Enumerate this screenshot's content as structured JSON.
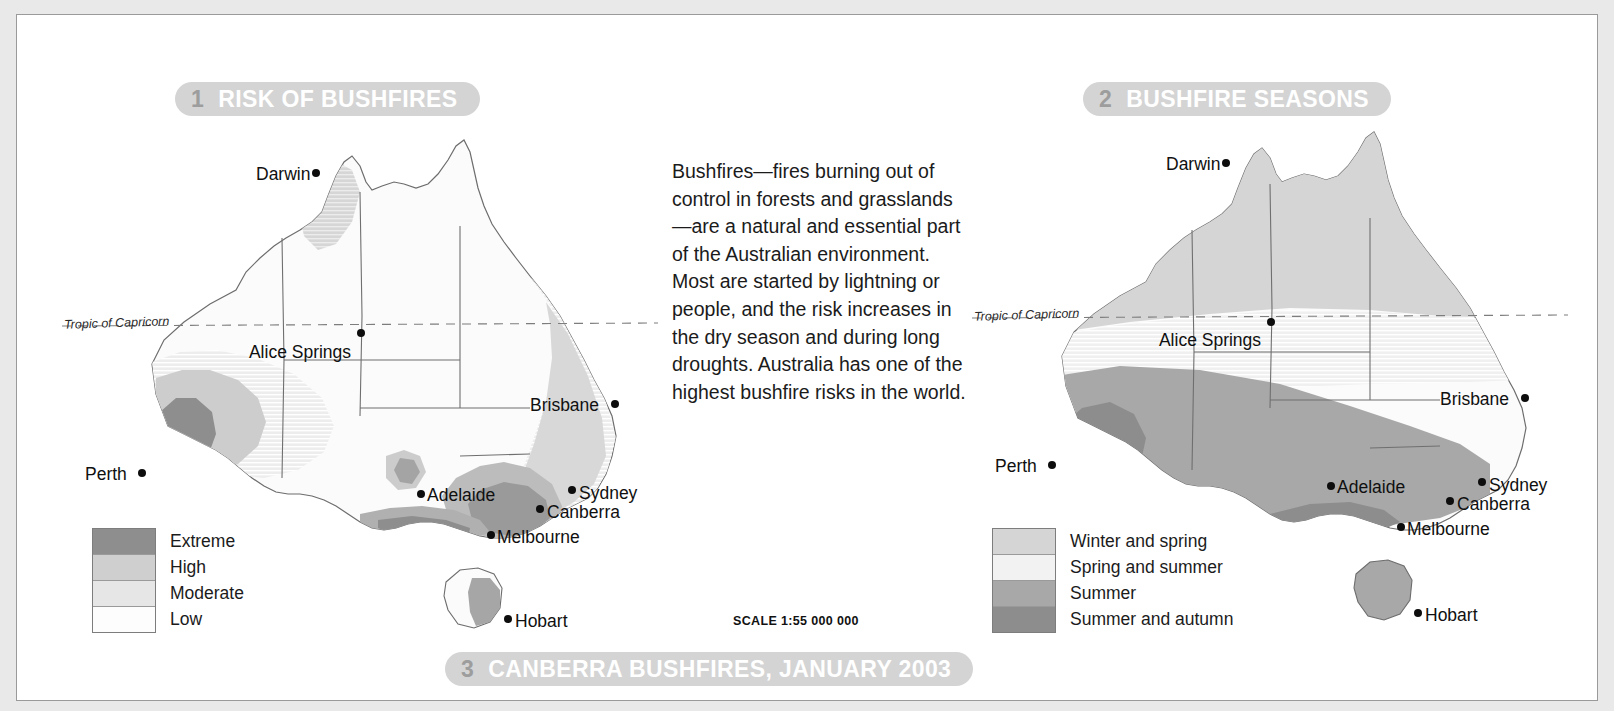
{
  "page": {
    "background": "#ffffff",
    "frame_color": "#e9e9e9",
    "pill_color": "#d4d4d4",
    "pill_number_color": "#9d9d9d",
    "pill_text_color": "#ffffff"
  },
  "sections": {
    "one": {
      "number": "1",
      "title": "RISK OF BUSHFIRES"
    },
    "two": {
      "number": "2",
      "title": "BUSHFIRE SEASONS"
    },
    "three": {
      "number": "3",
      "title": "CANBERRA BUSHFIRES, JANUARY 2003"
    }
  },
  "intro": {
    "text": "Bushfires—fires burning out of control in forests and grasslands—are a natural and essential part of the Australian environment. Most are started by lightning or people, and the risk increases in the dry season and during long droughts. Australia has one of the highest bushfire risks in the world."
  },
  "scale": {
    "label": "SCALE 1:55 000 000"
  },
  "legend_risk": {
    "items": [
      {
        "label": "Extreme",
        "color": "#8e8e8e"
      },
      {
        "label": "High",
        "color": "#cfcfcf"
      },
      {
        "label": "Moderate",
        "color": "#e6e6e6"
      },
      {
        "label": "Low",
        "color": "#fdfdfd"
      }
    ]
  },
  "legend_seasons": {
    "items": [
      {
        "label": "Winter and spring",
        "color": "#d5d5d5"
      },
      {
        "label": "Spring and summer",
        "color": "#f2f2f2"
      },
      {
        "label": "Summer",
        "color": "#a8a8a8"
      },
      {
        "label": "Summer and autumn",
        "color": "#8d8d8d"
      }
    ]
  },
  "map_risk": {
    "name": "risk-of-bushfires-map",
    "graticule_label": "Tropic of Capricorn",
    "cities": [
      {
        "name": "Darwin",
        "label_x": 196,
        "label_y": 40,
        "dot_x": 252,
        "dot_y": 43,
        "anchor": "right"
      },
      {
        "name": "Alice Springs",
        "label_x": 240,
        "label_y": 218,
        "dot_x": 297,
        "dot_y": 203,
        "anchor": "center"
      },
      {
        "name": "Brisbane",
        "label_x": 470,
        "label_y": 271,
        "dot_x": 551,
        "dot_y": 274,
        "anchor": "right"
      },
      {
        "name": "Perth",
        "label_x": 25,
        "label_y": 340,
        "dot_x": 78,
        "dot_y": 343,
        "anchor": "right"
      },
      {
        "name": "Adelaide",
        "label_x": 367,
        "label_y": 361,
        "dot_x": 357,
        "dot_y": 364,
        "anchor": "left"
      },
      {
        "name": "Sydney",
        "label_x": 519,
        "label_y": 359,
        "dot_x": 508,
        "dot_y": 360,
        "anchor": "left"
      },
      {
        "name": "Canberra",
        "label_x": 487,
        "label_y": 378,
        "dot_x": 476,
        "dot_y": 379,
        "anchor": "left"
      },
      {
        "name": "Melbourne",
        "label_x": 437,
        "label_y": 403,
        "dot_x": 427,
        "dot_y": 405,
        "anchor": "left"
      },
      {
        "name": "Hobart",
        "label_x": 455,
        "label_y": 487,
        "dot_x": 444,
        "dot_y": 489,
        "anchor": "left"
      }
    ]
  },
  "map_seasons": {
    "name": "bushfire-seasons-map",
    "graticule_label": "Tropic of Capricorn",
    "cities": [
      {
        "name": "Darwin",
        "label_x": 196,
        "label_y": 30,
        "dot_x": 252,
        "dot_y": 33,
        "anchor": "right"
      },
      {
        "name": "Alice Springs",
        "label_x": 240,
        "label_y": 206,
        "dot_x": 297,
        "dot_y": 192,
        "anchor": "center"
      },
      {
        "name": "Brisbane",
        "label_x": 470,
        "label_y": 265,
        "dot_x": 551,
        "dot_y": 268,
        "anchor": "right"
      },
      {
        "name": "Perth",
        "label_x": 25,
        "label_y": 332,
        "dot_x": 78,
        "dot_y": 335,
        "anchor": "right"
      },
      {
        "name": "Adelaide",
        "label_x": 367,
        "label_y": 353,
        "dot_x": 357,
        "dot_y": 356,
        "anchor": "left"
      },
      {
        "name": "Sydney",
        "label_x": 519,
        "label_y": 351,
        "dot_x": 508,
        "dot_y": 352,
        "anchor": "left"
      },
      {
        "name": "Canberra",
        "label_x": 487,
        "label_y": 370,
        "dot_x": 476,
        "dot_y": 371,
        "anchor": "left"
      },
      {
        "name": "Melbourne",
        "label_x": 437,
        "label_y": 395,
        "dot_x": 427,
        "dot_y": 397,
        "anchor": "left"
      },
      {
        "name": "Hobart",
        "label_x": 455,
        "label_y": 481,
        "dot_x": 444,
        "dot_y": 483,
        "anchor": "left"
      }
    ]
  }
}
